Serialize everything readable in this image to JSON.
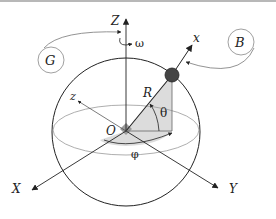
{
  "diagram": {
    "labels": {
      "Z": "Z",
      "omega": "ω",
      "G": "G",
      "B": "B",
      "x": "x",
      "z": "z",
      "R": "R",
      "theta": "θ",
      "O": "O",
      "phi": "φ",
      "X": "X",
      "Y": "Y"
    },
    "colors": {
      "stroke": "#222222",
      "light_stroke": "#888888",
      "shade": "#d9d9d9",
      "origin_box": "#9a9a9a",
      "ball": "#444444"
    }
  }
}
